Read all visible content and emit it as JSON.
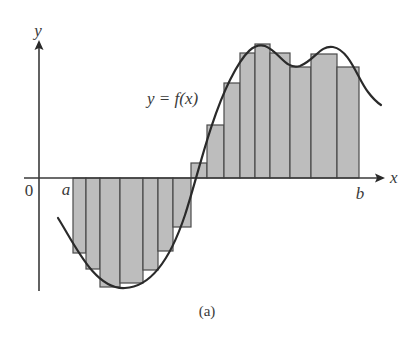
{
  "figure": {
    "caption": "(a)",
    "curve_label": "y = f(x)",
    "axis_labels": {
      "x": "x",
      "y": "y"
    },
    "origin_label": "0",
    "interval_labels": {
      "a": "a",
      "b": "b"
    },
    "colors": {
      "rect_fill": "#bdbdbd",
      "rect_stroke": "#4a4a4a",
      "curve": "#2a2a2a",
      "axis": "#3a3a3a",
      "background": "#ffffff"
    }
  },
  "chart_data": {
    "type": "riemann-sum-diagram",
    "title": "",
    "caption": "(a)",
    "xlabel": "x",
    "ylabel": "y",
    "curve_label": "y = f(x)",
    "interval": [
      "a",
      "b"
    ],
    "axis_px": {
      "x_axis_y": 178,
      "x_start": 24,
      "x_end": 384,
      "y_axis_x": 39,
      "y_top": 40,
      "y_bottom": 290
    },
    "rectangles_px": [
      {
        "x0": 73,
        "x1": 86,
        "y": 253
      },
      {
        "x0": 86,
        "x1": 100,
        "y": 269
      },
      {
        "x0": 100,
        "x1": 120,
        "y": 287
      },
      {
        "x0": 120,
        "x1": 143,
        "y": 283
      },
      {
        "x0": 143,
        "x1": 158,
        "y": 270
      },
      {
        "x0": 158,
        "x1": 173,
        "y": 251
      },
      {
        "x0": 173,
        "x1": 191,
        "y": 227
      },
      {
        "x0": 191,
        "x1": 207,
        "y": 163
      },
      {
        "x0": 207,
        "x1": 224,
        "y": 125
      },
      {
        "x0": 224,
        "x1": 240,
        "y": 83
      },
      {
        "x0": 240,
        "x1": 255,
        "y": 53
      },
      {
        "x0": 255,
        "x1": 270,
        "y": 44
      },
      {
        "x0": 270,
        "x1": 290,
        "y": 53
      },
      {
        "x0": 290,
        "x1": 311,
        "y": 67
      },
      {
        "x0": 311,
        "x1": 337,
        "y": 54
      },
      {
        "x0": 337,
        "x1": 359,
        "y": 67
      }
    ],
    "curve_px": "M58,218 C75,245 95,290 125,288 C150,287 170,260 185,215 C198,175 210,120 230,80 C245,50 255,43 265,46 C280,52 285,70 300,66 C315,60 320,45 333,47 C350,50 358,80 368,92 C374,100 378,103 381,105"
  }
}
